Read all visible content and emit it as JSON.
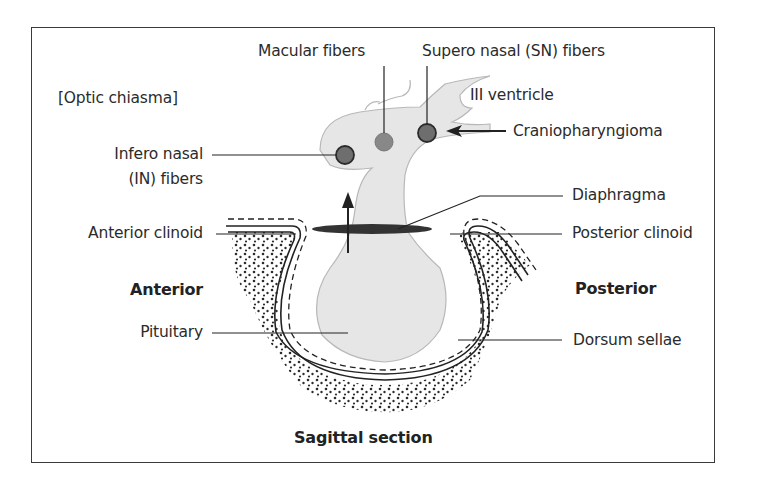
{
  "figure": {
    "section_label": "[Optic chiasma]",
    "orientation_anterior": "Anterior",
    "orientation_posterior": "Posterior",
    "caption": "Sagittal section"
  },
  "labels": {
    "macular_fibers": "Macular fibers",
    "supero_nasal": "Supero nasal (SN) fibers",
    "iii_ventricle": "III ventricle",
    "craniopharyngioma": "Craniopharyngioma",
    "infero_nasal_line1": "Infero nasal",
    "infero_nasal_line2": "(IN) fibers",
    "diaphragma": "Diaphragma",
    "anterior_clinoid": "Anterior clinoid",
    "posterior_clinoid": "Posterior clinoid",
    "pituitary": "Pituitary",
    "dorsum_sellae": "Dorsum sellae"
  },
  "colors": {
    "tissue_fill": "#e6e6e6",
    "tissue_outline": "#b8b8b8",
    "fiber_dot": "#6e6e6e",
    "line": "#2b2b2b",
    "diaphragma": "#3a3a3a"
  }
}
